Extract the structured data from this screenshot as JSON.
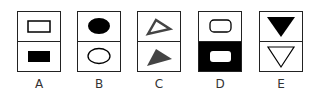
{
  "options": [
    {
      "label": "A",
      "top": "hollow rectangle",
      "bottom": "filled rectangle"
    },
    {
      "label": "B",
      "top": "filled ellipse",
      "bottom": "hollow ellipse"
    },
    {
      "label": "C",
      "top": "hollow triangle (pointing right)",
      "bottom": "filled gray triangle (pointing right)"
    },
    {
      "label": "D",
      "top": "hollow rounded rectangle on white",
      "bottom": "white rounded rectangle on black"
    },
    {
      "label": "E",
      "top": "filled downward triangle",
      "bottom": "hollow downward triangle"
    }
  ],
  "colors": {
    "ink": "#000000",
    "gray": "#555555",
    "background": "#ffffff"
  }
}
